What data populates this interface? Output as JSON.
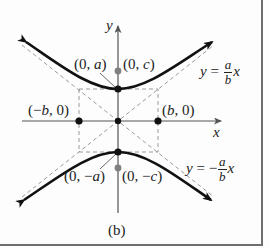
{
  "figure": {
    "caption": "(b)",
    "axes": {
      "x_label": "x",
      "y_label": "y"
    },
    "points": {
      "vertex_top": {
        "label_open": "(0, ",
        "label_var": "a",
        "label_close": ")"
      },
      "focus_top": {
        "label_open": "(0, ",
        "label_var": "c",
        "label_close": ")"
      },
      "vertex_left": {
        "label_open": "(−",
        "label_var": "b",
        "label_close": ", 0)"
      },
      "vertex_right": {
        "label_open": "(",
        "label_var": "b",
        "label_close": ", 0)"
      },
      "vertex_bottom": {
        "label_open": "(0, −",
        "label_var": "a",
        "label_close": ")"
      },
      "focus_bottom": {
        "label_open": "(0, −",
        "label_var": "c",
        "label_close": ")"
      }
    },
    "asymptotes": {
      "positive": {
        "lhs": "y",
        "eq": " = ",
        "sign": "",
        "num": "a",
        "den": "b",
        "var": "x"
      },
      "negative": {
        "lhs": "y",
        "eq": " = ",
        "sign": "−",
        "num": "a",
        "den": "b",
        "var": "x"
      }
    },
    "colors": {
      "curve": "#111111",
      "axis": "#555555",
      "dashed": "#9a9a9a",
      "focus": "#808080",
      "frame": "#6e6e6e"
    }
  }
}
